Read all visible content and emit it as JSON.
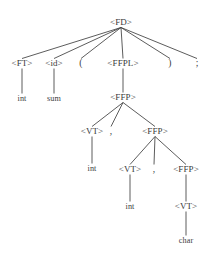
{
  "figure": {
    "type": "parse-tree",
    "colors": {
      "background": "#ffffff",
      "edge": "#4a4a4a",
      "text": "#3a3a3a"
    }
  },
  "nodes": [
    {
      "id": "fd",
      "label": "<FD>",
      "kind": "nonterminal",
      "x": 121,
      "y": 25
    },
    {
      "id": "ft",
      "label": "<FT>",
      "kind": "nonterminal",
      "x": 22,
      "y": 66
    },
    {
      "id": "id",
      "label": "<id>",
      "kind": "nonterminal",
      "x": 54,
      "y": 66
    },
    {
      "id": "lparen",
      "label": "(",
      "kind": "terminal",
      "x": 81,
      "y": 66
    },
    {
      "id": "ffpl",
      "label": "<FFPL>",
      "kind": "nonterminal",
      "x": 123,
      "y": 66
    },
    {
      "id": "rparen",
      "label": ")",
      "kind": "terminal",
      "x": 170,
      "y": 66
    },
    {
      "id": "semicolon",
      "label": ";",
      "kind": "terminal",
      "x": 197,
      "y": 66
    },
    {
      "id": "int1",
      "label": "int",
      "kind": "terminal",
      "x": 22,
      "y": 101
    },
    {
      "id": "sum",
      "label": "sum",
      "kind": "terminal",
      "x": 54,
      "y": 101
    },
    {
      "id": "ffp1",
      "label": "<FFP>",
      "kind": "nonterminal",
      "x": 123,
      "y": 100
    },
    {
      "id": "vt1",
      "label": "<VT>",
      "kind": "nonterminal",
      "x": 92,
      "y": 134
    },
    {
      "id": "comma1",
      "label": ",",
      "kind": "terminal",
      "x": 111,
      "y": 134
    },
    {
      "id": "ffp2",
      "label": "<FFP>",
      "kind": "nonterminal",
      "x": 155,
      "y": 134
    },
    {
      "id": "int2",
      "label": "int",
      "kind": "terminal",
      "x": 92,
      "y": 171
    },
    {
      "id": "vt2",
      "label": "<VT>",
      "kind": "nonterminal",
      "x": 130,
      "y": 172
    },
    {
      "id": "comma2",
      "label": ",",
      "kind": "terminal",
      "x": 154,
      "y": 172
    },
    {
      "id": "ffp3",
      "label": "<FFP>",
      "kind": "nonterminal",
      "x": 186,
      "y": 172
    },
    {
      "id": "int3",
      "label": "int",
      "kind": "terminal",
      "x": 130,
      "y": 209
    },
    {
      "id": "vt3",
      "label": "<VT>",
      "kind": "nonterminal",
      "x": 186,
      "y": 209
    },
    {
      "id": "char",
      "label": "char",
      "kind": "terminal",
      "x": 186,
      "y": 243
    }
  ],
  "edges": [
    {
      "from": "fd",
      "to": "ft"
    },
    {
      "from": "fd",
      "to": "id"
    },
    {
      "from": "fd",
      "to": "lparen"
    },
    {
      "from": "fd",
      "to": "ffpl"
    },
    {
      "from": "fd",
      "to": "rparen"
    },
    {
      "from": "fd",
      "to": "semicolon"
    },
    {
      "from": "ft",
      "to": "int1"
    },
    {
      "from": "id",
      "to": "sum"
    },
    {
      "from": "ffpl",
      "to": "ffp1"
    },
    {
      "from": "ffp1",
      "to": "vt1"
    },
    {
      "from": "ffp1",
      "to": "comma1"
    },
    {
      "from": "ffp1",
      "to": "ffp2"
    },
    {
      "from": "vt1",
      "to": "int2"
    },
    {
      "from": "ffp2",
      "to": "vt2"
    },
    {
      "from": "ffp2",
      "to": "comma2"
    },
    {
      "from": "ffp2",
      "to": "ffp3"
    },
    {
      "from": "vt2",
      "to": "int3"
    },
    {
      "from": "ffp3",
      "to": "vt3"
    },
    {
      "from": "vt3",
      "to": "char"
    }
  ]
}
